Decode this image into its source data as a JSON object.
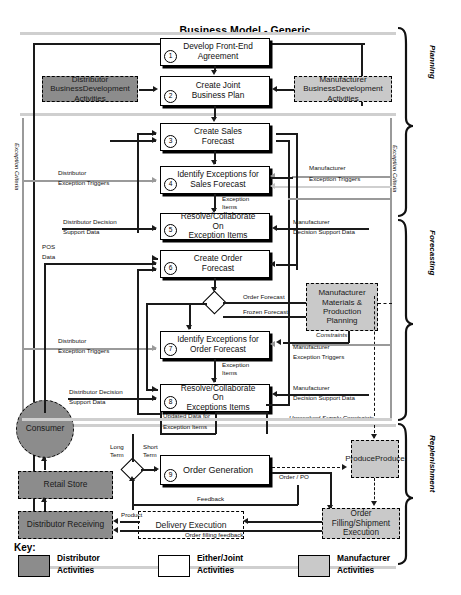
{
  "title": "Business Model - Generic",
  "phases": [
    {
      "id": "planning",
      "label": "Planning"
    },
    {
      "id": "forecasting",
      "label": "Forecasting"
    },
    {
      "id": "replenishment",
      "label": "Replenishment"
    }
  ],
  "side_labels": {
    "left_exception_criteria": "Exception Criteria",
    "right_exception_criteria": "Exception Criteria"
  },
  "process_steps": [
    {
      "num": "1",
      "label": "Develop Front-End\nAgreement",
      "line1": "Develop Front-End",
      "line2": "Agreement"
    },
    {
      "num": "2",
      "label": "Create Joint\nBusiness Plan",
      "line1": "Create Joint",
      "line2": "Business Plan"
    },
    {
      "num": "3",
      "label": "Create Sales\nForecast",
      "line1": "Create Sales",
      "line2": "Forecast"
    },
    {
      "num": "4",
      "label": "Identify Exceptions for\nSales Forecast",
      "line1": "Identify Exceptions for",
      "line2": "Sales Forecast"
    },
    {
      "num": "5",
      "label": "Resolve/Collaborate On\nException Items",
      "line1": "Resolve/Collaborate On",
      "line2": "Exception Items"
    },
    {
      "num": "6",
      "label": "Create Order\nForecast",
      "line1": "Create Order",
      "line2": "Forecast"
    },
    {
      "num": "7",
      "label": "Identify Exceptions for\nOrder Forecast",
      "line1": "Identify Exceptions for",
      "line2": "Order Forecast"
    },
    {
      "num": "8",
      "label": "Resolve/Collaborate On\nExceptions Items",
      "line1": "Resolve/Collaborate On",
      "line2": "Exceptions Items"
    },
    {
      "num": "9",
      "label": "Order Generation",
      "line1": "Order Generation",
      "line2": ""
    }
  ],
  "external_boxes": [
    {
      "id": "distributor-business-development",
      "line1": "Distributor Business",
      "line2": "Development Activities",
      "fill": "dark"
    },
    {
      "id": "manufacturer-business-development",
      "line1": "Manufacturer Business",
      "line2": "Development Activities",
      "fill": "light"
    },
    {
      "id": "manufacturer-materials-production-planning",
      "line1": "Manufacturer",
      "line2": "Materials &",
      "line3": "Production",
      "line4": "Planning",
      "fill": "light"
    },
    {
      "id": "consumer",
      "line1": "Consumer",
      "fill": "dark"
    },
    {
      "id": "retail-store",
      "line1": "Retail Store",
      "fill": "dark"
    },
    {
      "id": "distributor-receiving",
      "line1": "Distributor Receiving",
      "fill": "dark"
    },
    {
      "id": "delivery-execution",
      "line1": "Delivery Execution",
      "fill": "white"
    },
    {
      "id": "produce-produce",
      "line1": "Produce",
      "line2": "Produce",
      "fill": "light"
    },
    {
      "id": "order-filling-shipment-execution",
      "line1": "Order Filling/",
      "line2": "Shipment Execution",
      "fill": "light"
    }
  ],
  "flow_labels": {
    "distributor_exception_triggers_1": "Distributor",
    "distributor_exception_triggers_2": "Exception Triggers",
    "manufacturer_exception_triggers_1": "Manufacturer",
    "manufacturer_exception_triggers_2": "Exception Triggers",
    "distributor_decision_support_1": "Distributor Decision",
    "distributor_decision_support_2": "Support Data",
    "manufacturer_decision_support_1": "Manufacturer",
    "manufacturer_decision_support_2": "Decision Support Data",
    "pos_data_1": "POS",
    "pos_data_2": "Data",
    "exception_items_1": "Exception",
    "exception_items_2": "Items",
    "order_forecast": "Order Forecast",
    "frozen_forecast": "Frozen Forecast",
    "constraints": "Constraints",
    "unresolved_supply_constraints": "Unresolved Supply Constraints",
    "updated_data_1": "Updated Data for",
    "updated_data_2": "Exception Items",
    "long_term_1": "Long",
    "long_term_2": "Term",
    "short_term_1": "Short",
    "short_term_2": "Term",
    "order_po": "Order / PO",
    "feedback": "Feedback",
    "product": "Product",
    "order_filling_feedback": "Order filling feedback",
    "distributor_decision_support_b1": "Distributor Decision",
    "distributor_decision_support_b2": "Support Data",
    "manufacturer_decision_support_b1": "Manufacturer",
    "manufacturer_decision_support_b2": "Decision Support Data",
    "distributor_exception_triggers_b1": "Distributor",
    "distributor_exception_triggers_b2": "Exception Triggers",
    "manufacturer_exception_triggers_b1": "Manufacturer",
    "manufacturer_exception_triggers_b2": "Exception Triggers"
  },
  "key": {
    "title": "Key:",
    "items": [
      {
        "id": "distributor",
        "line1": "Distributor",
        "line2": "Activities",
        "fill": "dark",
        "color": "#8c8c8c"
      },
      {
        "id": "either-joint",
        "line1": "Either/Joint",
        "line2": "Activities",
        "fill": "white",
        "color": "#ffffff"
      },
      {
        "id": "manufacturer",
        "line1": "Manufacturer",
        "line2": "Activities",
        "fill": "light",
        "color": "#c9c9c9"
      }
    ]
  },
  "colors": {
    "distributor_fill": "#8c8c8c",
    "manufacturer_fill": "#c9c9c9",
    "joint_fill": "#ffffff",
    "line": "#1a1a1a",
    "gray_line": "#9a9a9a"
  }
}
